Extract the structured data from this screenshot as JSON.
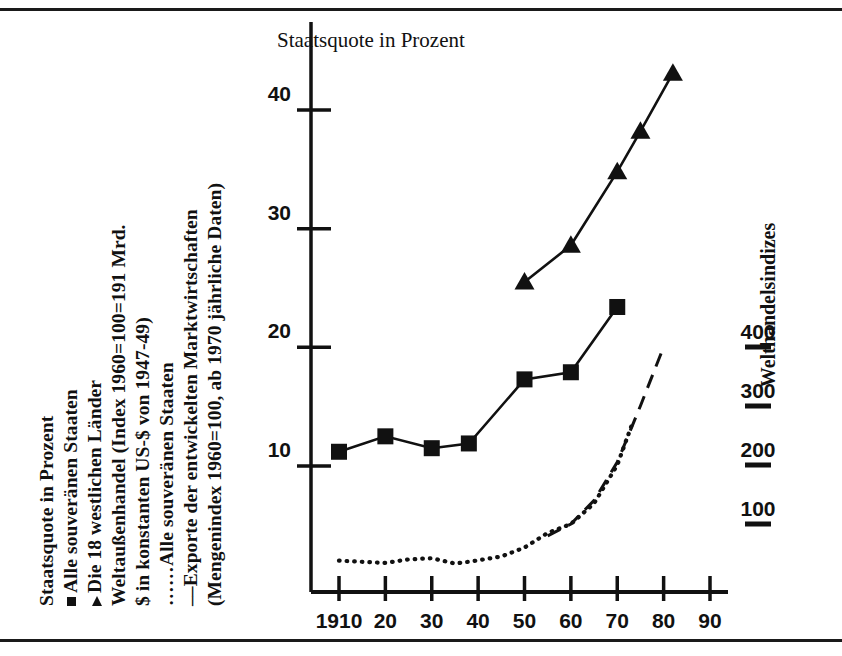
{
  "figure": {
    "title": "Staatsquote in Prozent",
    "right_axis_label": "Welthandelsindizes"
  },
  "legend": {
    "lines": [
      {
        "marker": "none",
        "text": "Staatsquote in Prozent"
      },
      {
        "marker": "square",
        "text": "Alle souveränen Staaten"
      },
      {
        "marker": "triangle",
        "text": "Die 18 westlichen Länder"
      },
      {
        "marker": "none",
        "text": "Weltaußenhandel (Index 1960=100=191 Mrd."
      },
      {
        "marker": "none",
        "text": "$ in konstanten US-$ von 1947-49)"
      },
      {
        "marker": "dotted",
        "text": "Alle souveränen Staaten"
      },
      {
        "marker": "dashed",
        "text": "Exporte der entwickelten Marktwirtschaften"
      },
      {
        "marker": "none",
        "text": "(Mengenindex 1960=100, ab 1970 jährliche Daten)"
      }
    ],
    "dotted_glyph": "……",
    "dashed_glyph": "––"
  },
  "chart_data": {
    "type": "line",
    "title": "Staatsquote in Prozent",
    "xlabel": "",
    "ylabel": "Staatsquote in Prozent",
    "y2label": "Welthandelsindizes",
    "xlim": [
      1910,
      1990
    ],
    "ylim": [
      0,
      45
    ],
    "y2lim": [
      0,
      700
    ],
    "grid": false,
    "legend_position": "left-rotated",
    "x_ticks": [
      1910,
      1920,
      1930,
      1940,
      1950,
      1960,
      1970,
      1980,
      1990
    ],
    "x_tick_labels": [
      "1910",
      "20",
      "30",
      "40",
      "50",
      "60",
      "70",
      "80",
      "90"
    ],
    "y_ticks": [
      10,
      20,
      30,
      40
    ],
    "y_tick_labels": [
      "10",
      "20",
      "30",
      "40"
    ],
    "y2_ticks": [
      100,
      200,
      300,
      400
    ],
    "y2_tick_labels": [
      "100",
      "200",
      "300",
      "400"
    ],
    "series": [
      {
        "name": "Alle souveränen Staaten",
        "marker": "square",
        "linestyle": "solid",
        "axis": "left",
        "x": [
          1910,
          1920,
          1930,
          1938,
          1950,
          1960,
          1970
        ],
        "values": [
          11.2,
          12.5,
          11.5,
          11.9,
          17.3,
          17.9,
          23.4
        ]
      },
      {
        "name": "Die 18 westlichen Länder",
        "marker": "triangle",
        "linestyle": "solid",
        "axis": "left",
        "x": [
          1950,
          1960,
          1970,
          1975,
          1982
        ],
        "values": [
          25.5,
          28.6,
          34.8,
          38.2,
          43.1
        ]
      },
      {
        "name": "Alle souveränen Staaten (Welthandel)",
        "marker": "none",
        "linestyle": "dotted",
        "axis": "right",
        "x": [
          1910,
          1915,
          1920,
          1925,
          1930,
          1935,
          1938,
          1945,
          1950,
          1955,
          1960,
          1965,
          1970,
          1973
        ],
        "values": [
          38,
          36,
          34,
          40,
          42,
          33,
          36,
          45,
          60,
          85,
          100,
          135,
          200,
          265
        ]
      },
      {
        "name": "Exporte der entwickelten Marktwirtschaften",
        "marker": "none",
        "linestyle": "dashed",
        "axis": "right",
        "x": [
          1955,
          1960,
          1965,
          1970,
          1975,
          1980
        ],
        "values": [
          80,
          100,
          140,
          205,
          300,
          400
        ]
      }
    ]
  }
}
